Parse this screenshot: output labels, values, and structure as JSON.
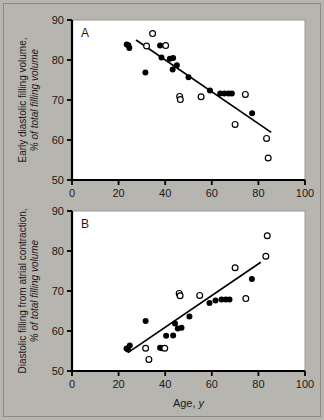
{
  "figure": {
    "background_color": "#b7b5b0",
    "plot_background_color": "#ffffff",
    "ink_color": "#000000"
  },
  "axis": {
    "x_ticks": [
      "0",
      "20",
      "40",
      "60",
      "80",
      "100"
    ],
    "y_ticks": [
      "50",
      "60",
      "70",
      "80",
      "90"
    ],
    "xlabel_main": "Age,",
    "xlabel_em": "y"
  },
  "panel_a": {
    "letter": "A",
    "ylabel_line1": "Early diastolic filling volume,",
    "ylabel_line2": "% of total filling volume"
  },
  "panel_b": {
    "letter": "B",
    "ylabel_line1": "Diastolic filling from atrial contraction,",
    "ylabel_line2": "% of total filling volume"
  },
  "chart_data": [
    {
      "type": "scatter",
      "panel": "A",
      "title": "",
      "xlabel": "Age, y",
      "ylabel": "Early diastolic filling volume, % of total filling volume",
      "xlim": [
        0,
        100
      ],
      "ylim": [
        50,
        90
      ],
      "xticks": [
        0,
        20,
        40,
        60,
        80,
        100
      ],
      "yticks": [
        50,
        60,
        70,
        80,
        90
      ],
      "grid": false,
      "legend": "none",
      "series": [
        {
          "name": "filled",
          "marker": "filled-circle",
          "points": [
            [
              23.5,
              83.9
            ],
            [
              24.2,
              83.7
            ],
            [
              24.6,
              83.0
            ],
            [
              31.5,
              76.9
            ],
            [
              37.8,
              83.6
            ],
            [
              38.4,
              80.6
            ],
            [
              42.0,
              80.3
            ],
            [
              43.4,
              80.5
            ],
            [
              43.2,
              77.6
            ],
            [
              45.0,
              78.7
            ],
            [
              50.0,
              75.7
            ],
            [
              59.2,
              72.4
            ],
            [
              63.6,
              71.6
            ],
            [
              65.4,
              71.6
            ],
            [
              67.2,
              71.6
            ],
            [
              68.6,
              71.6
            ],
            [
              77.3,
              66.7
            ]
          ]
        },
        {
          "name": "open",
          "marker": "open-circle",
          "points": [
            [
              32.0,
              83.5
            ],
            [
              34.6,
              86.6
            ],
            [
              40.2,
              83.6
            ],
            [
              46.2,
              70.9
            ],
            [
              46.5,
              70.1
            ],
            [
              55.4,
              70.8
            ],
            [
              70.0,
              63.9
            ],
            [
              74.4,
              71.4
            ],
            [
              83.5,
              60.4
            ],
            [
              84.2,
              55.5
            ]
          ]
        }
      ],
      "trendline": {
        "x1": 27.5,
        "y1": 85.0,
        "x2": 85.5,
        "y2": 61.9
      }
    },
    {
      "type": "scatter",
      "panel": "B",
      "title": "",
      "xlabel": "Age, y",
      "ylabel": "Diastolic filling from atrial contraction, % of total filling volume",
      "xlim": [
        0,
        100
      ],
      "ylim": [
        50,
        90
      ],
      "xticks": [
        0,
        20,
        40,
        60,
        80,
        100
      ],
      "yticks": [
        50,
        60,
        70,
        80,
        90
      ],
      "grid": false,
      "legend": "none",
      "series": [
        {
          "name": "filled",
          "marker": "filled-circle",
          "points": [
            [
              23.4,
              55.6
            ],
            [
              24.0,
              55.4
            ],
            [
              24.8,
              56.4
            ],
            [
              31.6,
              62.5
            ],
            [
              37.8,
              55.8
            ],
            [
              38.6,
              55.7
            ],
            [
              40.4,
              58.8
            ],
            [
              43.4,
              58.9
            ],
            [
              44.2,
              61.9
            ],
            [
              45.4,
              60.6
            ],
            [
              47.0,
              60.8
            ],
            [
              50.4,
              63.6
            ],
            [
              59.0,
              67.0
            ],
            [
              61.6,
              67.6
            ],
            [
              64.2,
              67.9
            ],
            [
              66.0,
              67.9
            ],
            [
              67.6,
              67.9
            ],
            [
              77.2,
              73.0
            ]
          ]
        },
        {
          "name": "open",
          "marker": "open-circle",
          "points": [
            [
              31.6,
              55.7
            ],
            [
              33.0,
              52.9
            ],
            [
              39.8,
              55.7
            ],
            [
              46.0,
              69.4
            ],
            [
              46.4,
              68.8
            ],
            [
              54.8,
              68.9
            ],
            [
              70.0,
              75.8
            ],
            [
              74.6,
              68.1
            ],
            [
              83.2,
              78.7
            ],
            [
              83.8,
              83.8
            ]
          ]
        }
      ],
      "trendline": {
        "x1": 24.0,
        "y1": 54.6,
        "x2": 81.0,
        "y2": 77.2
      }
    }
  ]
}
